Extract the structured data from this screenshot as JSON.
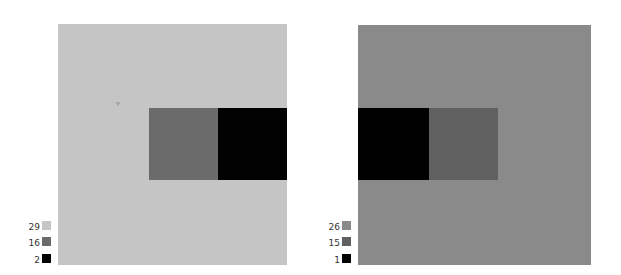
{
  "figure": {
    "panels": [
      {
        "id": "left",
        "background": "#c5c5c5",
        "rects": [
          {
            "name": "center-grey-rect",
            "color": "#6b6b6b"
          },
          {
            "name": "right-black-rect",
            "color": "#020202"
          }
        ],
        "legend": [
          {
            "label": "29",
            "color": "#c5c5c5"
          },
          {
            "label": "16",
            "color": "#6b6b6b"
          },
          {
            "label": "2",
            "color": "#020202"
          }
        ]
      },
      {
        "id": "right",
        "background": "#8a8a8a",
        "rects": [
          {
            "name": "left-black-rect",
            "color": "#010101"
          },
          {
            "name": "center-grey-rect",
            "color": "#606060"
          }
        ],
        "legend": [
          {
            "label": "26",
            "color": "#8a8a8a"
          },
          {
            "label": "15",
            "color": "#606060"
          },
          {
            "label": "1",
            "color": "#010101"
          }
        ]
      }
    ]
  }
}
